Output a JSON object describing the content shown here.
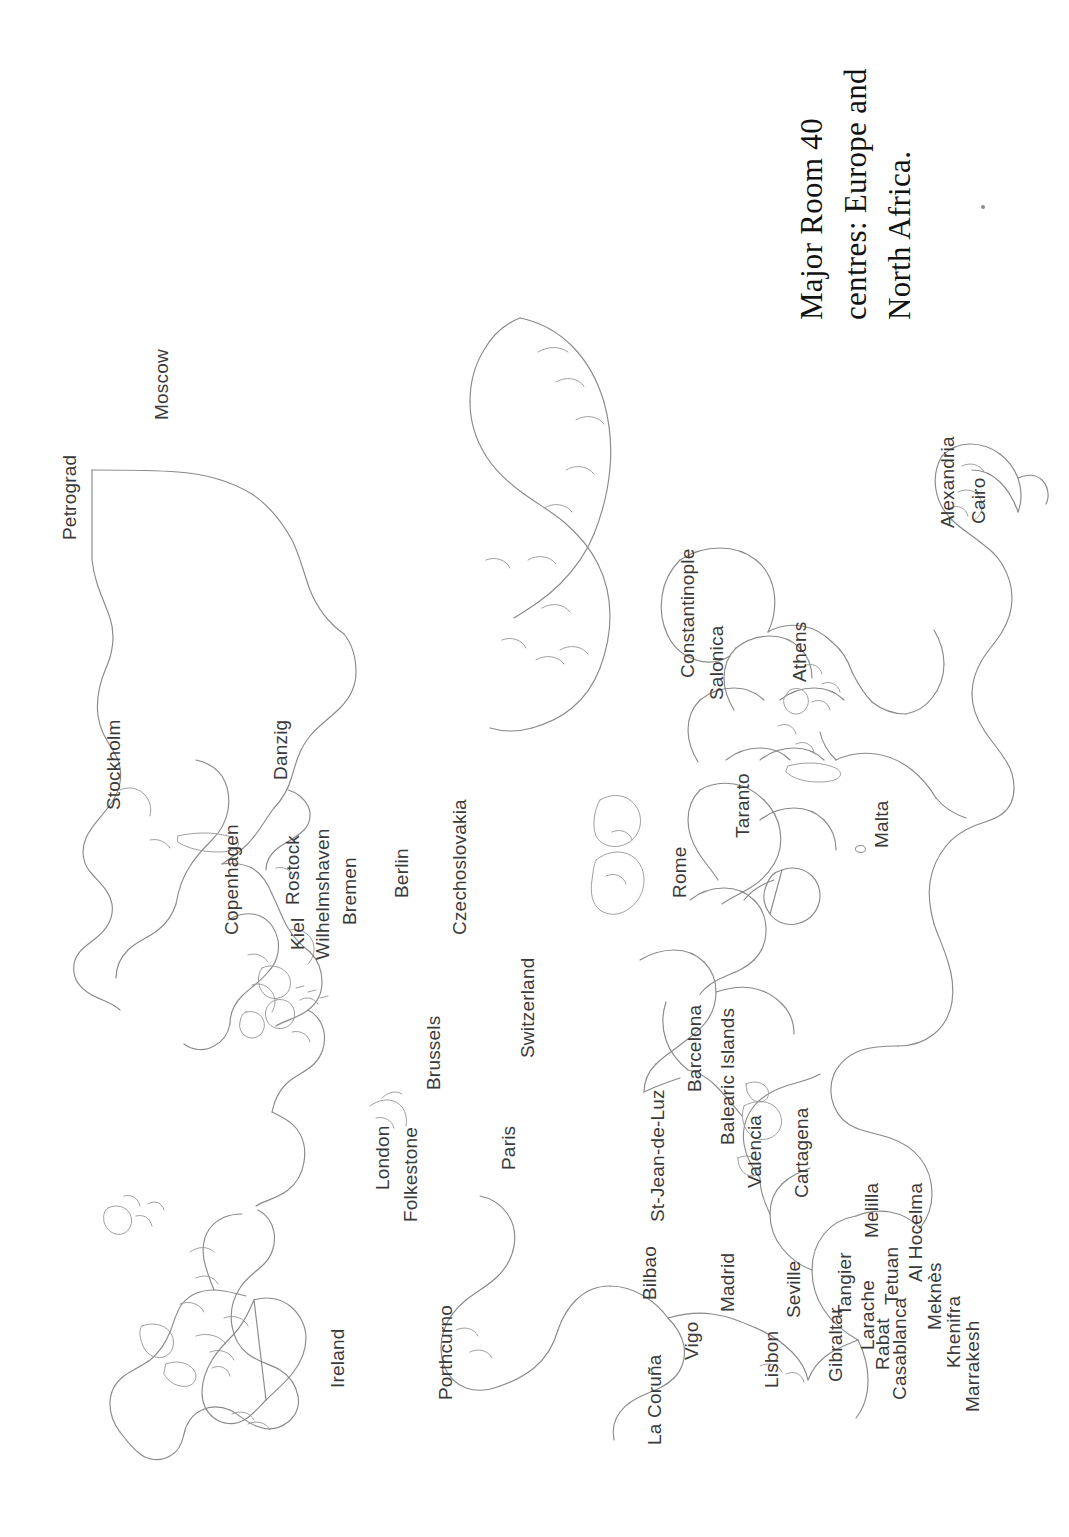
{
  "document": {
    "kind": "figure-plate",
    "page_background": "#ffffff",
    "orientation": "landscape-content-on-portrait-page",
    "outline_color": "#8a8a8a",
    "label_color": "#3a3a3a",
    "title_color": "#121212"
  },
  "title": {
    "lines": [
      "Major Room 40",
      "centres: Europe and",
      "North Africa."
    ],
    "full_text": "Major Room 40 centres: Europe and North Africa."
  },
  "map": {
    "region": "Europe and North Africa",
    "labels": [
      {
        "name": "Petrograd",
        "x": 60,
        "y": 540,
        "size": 19
      },
      {
        "name": "Moscow",
        "x": 152,
        "y": 420,
        "size": 19
      },
      {
        "name": "Stockholm",
        "x": 104,
        "y": 810,
        "size": 19
      },
      {
        "name": "Danzig",
        "x": 271,
        "y": 780,
        "size": 19
      },
      {
        "name": "Copenhagen",
        "x": 222,
        "y": 935,
        "size": 19
      },
      {
        "name": "Kiel",
        "x": 288,
        "y": 950,
        "size": 19
      },
      {
        "name": "Rostock",
        "x": 283,
        "y": 905,
        "size": 19
      },
      {
        "name": "Wilhelmshaven",
        "x": 313,
        "y": 960,
        "size": 19
      },
      {
        "name": "Bremen",
        "x": 340,
        "y": 925,
        "size": 19
      },
      {
        "name": "Berlin",
        "x": 392,
        "y": 898,
        "size": 19
      },
      {
        "name": "Czechoslovakia",
        "x": 450,
        "y": 935,
        "size": 19
      },
      {
        "name": "Switzerland",
        "x": 518,
        "y": 1058,
        "size": 19
      },
      {
        "name": "Brussels",
        "x": 424,
        "y": 1090,
        "size": 19
      },
      {
        "name": "London",
        "x": 373,
        "y": 1190,
        "size": 19
      },
      {
        "name": "Folkestone",
        "x": 401,
        "y": 1222,
        "size": 19
      },
      {
        "name": "Paris",
        "x": 499,
        "y": 1170,
        "size": 19
      },
      {
        "name": "Porthcurno",
        "x": 436,
        "y": 1400,
        "size": 19
      },
      {
        "name": "Ireland",
        "x": 328,
        "y": 1388,
        "size": 19
      },
      {
        "name": "La Coruña",
        "x": 645,
        "y": 1445,
        "size": 19
      },
      {
        "name": "Vigo",
        "x": 682,
        "y": 1360,
        "size": 19
      },
      {
        "name": "Bilbao",
        "x": 640,
        "y": 1300,
        "size": 19
      },
      {
        "name": "St-Jean-de-Luz",
        "x": 648,
        "y": 1222,
        "size": 19
      },
      {
        "name": "Barcelona",
        "x": 685,
        "y": 1092,
        "size": 19
      },
      {
        "name": "Balearic Islands",
        "x": 718,
        "y": 1145,
        "size": 19
      },
      {
        "name": "Valencia",
        "x": 745,
        "y": 1188,
        "size": 19
      },
      {
        "name": "Cartagena",
        "x": 792,
        "y": 1198,
        "size": 19
      },
      {
        "name": "Madrid",
        "x": 718,
        "y": 1312,
        "size": 19
      },
      {
        "name": "Lisbon",
        "x": 762,
        "y": 1388,
        "size": 19
      },
      {
        "name": "Seville",
        "x": 784,
        "y": 1318,
        "size": 19
      },
      {
        "name": "Gibraltar",
        "x": 826,
        "y": 1382,
        "size": 19
      },
      {
        "name": "Tangier",
        "x": 835,
        "y": 1316,
        "size": 19
      },
      {
        "name": "Larache",
        "x": 858,
        "y": 1350,
        "size": 19
      },
      {
        "name": "Melilla",
        "x": 862,
        "y": 1238,
        "size": 19
      },
      {
        "name": "Rabat",
        "x": 873,
        "y": 1370,
        "size": 19
      },
      {
        "name": "Tetuan",
        "x": 882,
        "y": 1305,
        "size": 19
      },
      {
        "name": "Casablanca",
        "x": 890,
        "y": 1400,
        "size": 19
      },
      {
        "name": "Al Hocelma",
        "x": 906,
        "y": 1282,
        "size": 19
      },
      {
        "name": "Meknès",
        "x": 925,
        "y": 1330,
        "size": 19
      },
      {
        "name": "Khenifra",
        "x": 944,
        "y": 1368,
        "size": 19
      },
      {
        "name": "Marrakesh",
        "x": 963,
        "y": 1412,
        "size": 19
      },
      {
        "name": "Rome",
        "x": 670,
        "y": 898,
        "size": 19
      },
      {
        "name": "Taranto",
        "x": 733,
        "y": 838,
        "size": 19
      },
      {
        "name": "Malta",
        "x": 872,
        "y": 848,
        "size": 19
      },
      {
        "name": "Constantinople",
        "x": 678,
        "y": 678,
        "size": 19
      },
      {
        "name": "Salonica",
        "x": 707,
        "y": 700,
        "size": 19
      },
      {
        "name": "Athens",
        "x": 790,
        "y": 682,
        "size": 19
      },
      {
        "name": "Alexandria",
        "x": 938,
        "y": 528,
        "size": 19
      },
      {
        "name": "Cairo",
        "x": 969,
        "y": 524,
        "size": 19
      }
    ],
    "symbols": [
      {
        "name": "malta-island-dot",
        "x": 855,
        "y": 845
      },
      {
        "name": "page-speck",
        "x": 981,
        "y": 205
      }
    ]
  }
}
